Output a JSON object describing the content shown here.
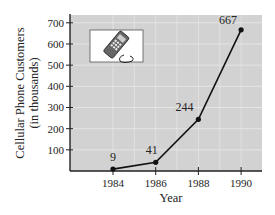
{
  "chart_data": {
    "type": "line",
    "title": "",
    "xlabel": "Year",
    "ylabel": "Cellular Phone Customers",
    "ylabel_sub": "(in thousands)",
    "categories": [
      "1984",
      "1986",
      "1988",
      "1990"
    ],
    "x": [
      1984,
      1986,
      1988,
      1990
    ],
    "values": [
      9,
      41,
      244,
      667
    ],
    "data_labels": [
      "9",
      "41",
      "244",
      "667"
    ],
    "yticks": [
      100,
      200,
      300,
      400,
      500,
      600,
      700
    ],
    "ylim": [
      0,
      750
    ],
    "xlim": [
      1983,
      1991
    ],
    "grid": true,
    "legend": null,
    "annotations": [
      "cell-phone illustration inset (top-left)"
    ]
  },
  "colors": {
    "plot_bg": "#d2d2d2",
    "grid": "#e4e4e4",
    "line": "#111111",
    "axis": "#222222",
    "inset_bg": "#ffffff"
  },
  "inset": {
    "icon": "cell-phone-icon"
  }
}
